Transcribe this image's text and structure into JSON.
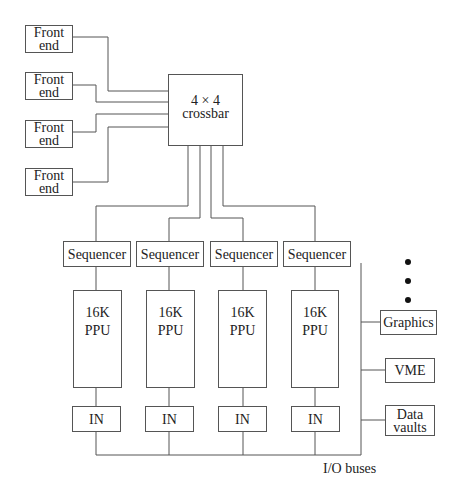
{
  "diagram": {
    "front_ends": [
      {
        "line1": "Front",
        "line2": "end"
      },
      {
        "line1": "Front",
        "line2": "end"
      },
      {
        "line1": "Front",
        "line2": "end"
      },
      {
        "line1": "Front",
        "line2": "end"
      }
    ],
    "crossbar": {
      "line1": "4 × 4",
      "line2": "crossbar"
    },
    "sequencers": [
      "Sequencer",
      "Sequencer",
      "Sequencer",
      "Sequencer"
    ],
    "ppus": [
      {
        "line1": "16K",
        "line2": "PPU"
      },
      {
        "line1": "16K",
        "line2": "PPU"
      },
      {
        "line1": "16K",
        "line2": "PPU"
      },
      {
        "line1": "16K",
        "line2": "PPU"
      }
    ],
    "ins": [
      "IN",
      "IN",
      "IN",
      "IN"
    ],
    "peripherals": {
      "graphics": "Graphics",
      "vme": "VME",
      "data_vaults": {
        "line1": "Data",
        "line2": "vaults"
      }
    },
    "bus_label": "I/O buses",
    "ellipsis_dots": 3,
    "line_color": "#555555"
  }
}
